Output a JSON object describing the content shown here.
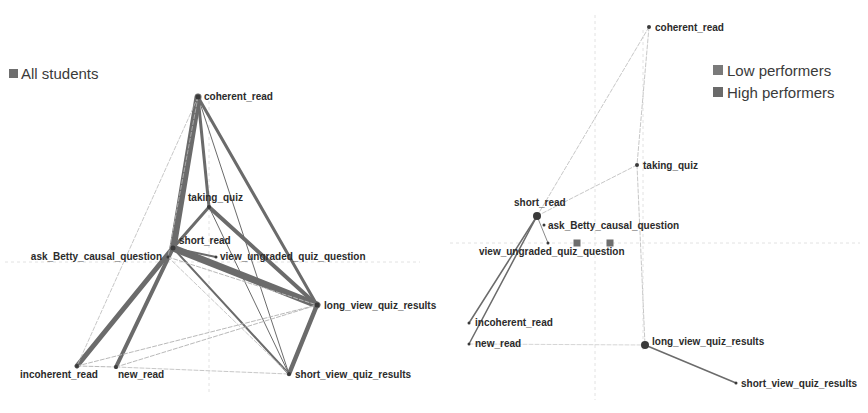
{
  "colors": {
    "edge": "#6b6b6b",
    "edge_light": "#b9b9b9",
    "node": "#3a3a3a",
    "legend_square": "#6e6e6e",
    "grid": "#e2e2e2"
  },
  "left_panel": {
    "legend": {
      "label": "All students"
    },
    "grid": {
      "vline_x": 209,
      "hline_y": 262
    },
    "nodes": [
      {
        "id": "coherent_read",
        "label": "coherent_read",
        "x": 198,
        "y": 97,
        "r": 2.5,
        "lx": 204,
        "ly": 100,
        "anchor": "start"
      },
      {
        "id": "taking_quiz",
        "label": "taking_quiz",
        "x": 209,
        "y": 207,
        "r": 2,
        "lx": 188,
        "ly": 201,
        "anchor": "start"
      },
      {
        "id": "short_read",
        "label": "short_read",
        "x": 173,
        "y": 248,
        "r": 2.5,
        "lx": 179,
        "ly": 244,
        "anchor": "start"
      },
      {
        "id": "ask_Betty_causal_question",
        "label": "ask_Betty_causal_question",
        "x": 168,
        "y": 257,
        "r": 1.5,
        "lx": 162,
        "ly": 260,
        "anchor": "end"
      },
      {
        "id": "view_ungraded_quiz_question",
        "label": "view_ungraded_quiz_question",
        "x": 216,
        "y": 257,
        "r": 1.5,
        "lx": 220,
        "ly": 260,
        "anchor": "start"
      },
      {
        "id": "long_view_quiz_results",
        "label": "long_view_quiz_results",
        "x": 317,
        "y": 305,
        "r": 2.5,
        "lx": 324,
        "ly": 309,
        "anchor": "start"
      },
      {
        "id": "incoherent_read",
        "label": "incoherent_read",
        "x": 77,
        "y": 366,
        "r": 2,
        "lx": 20,
        "ly": 378,
        "anchor": "start"
      },
      {
        "id": "new_read",
        "label": "new_read",
        "x": 116,
        "y": 367,
        "r": 2,
        "lx": 118,
        "ly": 378,
        "anchor": "start"
      },
      {
        "id": "short_view_quiz_results",
        "label": "short_view_quiz_results",
        "x": 289,
        "y": 374,
        "r": 2,
        "lx": 295,
        "ly": 378,
        "anchor": "start"
      }
    ],
    "edges": [
      {
        "from": "coherent_read",
        "to": "short_read",
        "w": 7
      },
      {
        "from": "short_read",
        "to": "long_view_quiz_results",
        "w": 7
      },
      {
        "from": "short_read",
        "to": "incoherent_read",
        "w": 5
      },
      {
        "from": "short_read",
        "to": "new_read",
        "w": 4
      },
      {
        "from": "long_view_quiz_results",
        "to": "short_view_quiz_results",
        "w": 4.5
      },
      {
        "from": "taking_quiz",
        "to": "long_view_quiz_results",
        "w": 4
      },
      {
        "from": "coherent_read",
        "to": "long_view_quiz_results",
        "w": 3
      },
      {
        "from": "short_read",
        "to": "taking_quiz",
        "w": 3
      },
      {
        "from": "coherent_read",
        "to": "taking_quiz",
        "w": 3
      },
      {
        "from": "short_read",
        "to": "short_view_quiz_results",
        "w": 2
      },
      {
        "from": "coherent_read",
        "to": "short_view_quiz_results",
        "w": 1
      },
      {
        "from": "taking_quiz",
        "to": "short_view_quiz_results",
        "w": 1
      },
      {
        "from": "short_read",
        "to": "view_ungraded_quiz_question",
        "w": 2
      },
      {
        "from": "coherent_read",
        "to": "incoherent_read",
        "w": 0.8,
        "light": true
      },
      {
        "from": "coherent_read",
        "to": "ask_Betty_causal_question",
        "w": 0.8,
        "light": true
      },
      {
        "from": "incoherent_read",
        "to": "new_read",
        "w": 1,
        "light": true
      },
      {
        "from": "incoherent_read",
        "to": "long_view_quiz_results",
        "w": 1,
        "light": true
      },
      {
        "from": "new_read",
        "to": "long_view_quiz_results",
        "w": 1,
        "light": true
      },
      {
        "from": "ask_Betty_causal_question",
        "to": "long_view_quiz_results",
        "w": 1,
        "light": true
      },
      {
        "from": "ask_Betty_causal_question",
        "to": "short_view_quiz_results",
        "w": 0.8,
        "light": true
      },
      {
        "from": "new_read",
        "to": "short_view_quiz_results",
        "w": 0.8,
        "light": true
      }
    ]
  },
  "right_panel": {
    "legend": [
      {
        "label": "Low performers"
      },
      {
        "label": "High performers"
      }
    ],
    "grid": {
      "vline1_x": 595,
      "vline2_x": 643,
      "hline_y": 243
    },
    "markers": [
      {
        "x": 577,
        "y": 243
      },
      {
        "x": 610,
        "y": 243
      }
    ],
    "nodes": [
      {
        "id": "coherent_read",
        "label": "coherent_read",
        "x": 649,
        "y": 27,
        "r": 2,
        "lx": 655,
        "ly": 31,
        "anchor": "start"
      },
      {
        "id": "taking_quiz",
        "label": "taking_quiz",
        "x": 637,
        "y": 165,
        "r": 2,
        "lx": 643,
        "ly": 169,
        "anchor": "start"
      },
      {
        "id": "short_read",
        "label": "short_read",
        "x": 537,
        "y": 216,
        "r": 4,
        "lx": 514,
        "ly": 206,
        "anchor": "start"
      },
      {
        "id": "ask_Betty_causal_question",
        "label": "ask_Betty_causal_question",
        "x": 544,
        "y": 225,
        "r": 1.5,
        "lx": 548,
        "ly": 229,
        "anchor": "start"
      },
      {
        "id": "view_ungraded_quiz_question",
        "label": "view_ungraded_quiz_question",
        "x": 548,
        "y": 243,
        "r": 1.5,
        "lx": 479,
        "ly": 255,
        "anchor": "start"
      },
      {
        "id": "incoherent_read",
        "label": "incoherent_read",
        "x": 469,
        "y": 323,
        "r": 1.5,
        "lx": 475,
        "ly": 326,
        "anchor": "start"
      },
      {
        "id": "new_read",
        "label": "new_read",
        "x": 469,
        "y": 344,
        "r": 1.5,
        "lx": 475,
        "ly": 347,
        "anchor": "start"
      },
      {
        "id": "long_view_quiz_results",
        "label": "long_view_quiz_results",
        "x": 645,
        "y": 345,
        "r": 4,
        "lx": 652,
        "ly": 345,
        "anchor": "start"
      },
      {
        "id": "short_view_quiz_results",
        "label": "short_view_quiz_results",
        "x": 736,
        "y": 383,
        "r": 1.5,
        "lx": 741,
        "ly": 387,
        "anchor": "start"
      }
    ],
    "edges": [
      {
        "from": "short_read",
        "to": "incoherent_read",
        "w": 1.5
      },
      {
        "from": "short_read",
        "to": "new_read",
        "w": 1.5
      },
      {
        "from": "long_view_quiz_results",
        "to": "short_view_quiz_results",
        "w": 1.5
      },
      {
        "from": "short_read",
        "to": "view_ungraded_quiz_question",
        "w": 0.8
      },
      {
        "from": "coherent_read",
        "to": "short_read",
        "w": 0.8,
        "light": true
      },
      {
        "from": "coherent_read",
        "to": "taking_quiz",
        "w": 0.8,
        "light": true
      },
      {
        "from": "taking_quiz",
        "to": "short_read",
        "w": 0.8,
        "light": true
      },
      {
        "from": "taking_quiz",
        "to": "long_view_quiz_results",
        "w": 0.8,
        "light": true
      },
      {
        "from": "new_read",
        "to": "long_view_quiz_results",
        "w": 0.6,
        "light": true
      }
    ]
  }
}
